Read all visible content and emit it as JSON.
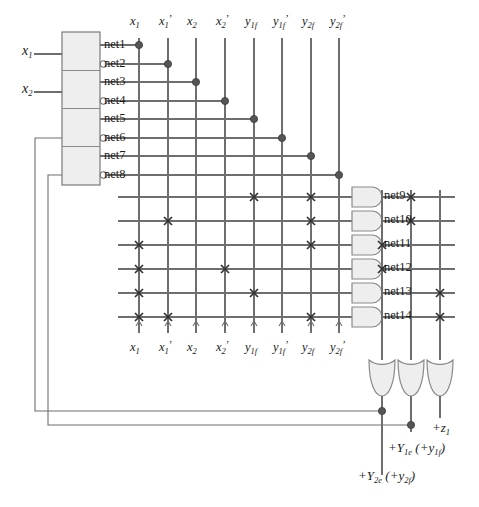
{
  "diagram": {
    "type": "logic-diagram",
    "colors": {
      "wire": "#6e6e6e",
      "dark_wire": "#3a3a3a",
      "dot": "#555555",
      "gate_fill": "#eeeeee",
      "gate_stroke": "#8a8a8a",
      "text": "#1a1a1a"
    }
  },
  "inputs": [
    {
      "name": "x1",
      "label_base": "x",
      "label_sub": "1",
      "y": 54
    },
    {
      "name": "x2",
      "label_base": "x",
      "label_sub": "2",
      "y": 92
    }
  ],
  "decoder": {
    "name": "input-buffer-block",
    "x": 62,
    "y": 32,
    "w": 38,
    "h": 153,
    "sections": 4,
    "nets": [
      {
        "label": "net1",
        "inverted": false,
        "y": 45
      },
      {
        "label": "net2",
        "inverted": true,
        "y": 64
      },
      {
        "label": "net3",
        "inverted": false,
        "y": 82
      },
      {
        "label": "net4",
        "inverted": true,
        "y": 101
      },
      {
        "label": "net5",
        "inverted": false,
        "y": 119
      },
      {
        "label": "net6",
        "inverted": true,
        "y": 138
      },
      {
        "label": "net7",
        "inverted": false,
        "y": 156
      },
      {
        "label": "net8",
        "inverted": true,
        "y": 175
      }
    ]
  },
  "columns": [
    {
      "index": 0,
      "x": 139,
      "base": "x",
      "sub": "1",
      "prime": false
    },
    {
      "index": 1,
      "x": 168,
      "base": "x",
      "sub": "1",
      "prime": true
    },
    {
      "index": 2,
      "x": 196,
      "base": "x",
      "sub": "2",
      "prime": false
    },
    {
      "index": 3,
      "x": 225,
      "base": "x",
      "sub": "2",
      "prime": true
    },
    {
      "index": 4,
      "x": 254,
      "base": "y",
      "sub": "1f",
      "prime": false
    },
    {
      "index": 5,
      "x": 282,
      "base": "y",
      "sub": "1f",
      "prime": true
    },
    {
      "index": 6,
      "x": 311,
      "base": "y",
      "sub": "2f",
      "prime": false
    },
    {
      "index": 7,
      "x": 339,
      "base": "y",
      "sub": "2f",
      "prime": true
    }
  ],
  "connection_dots": [
    {
      "net": "net1",
      "column": 0,
      "x": 139,
      "y": 45
    },
    {
      "net": "net2",
      "column": 1,
      "x": 168,
      "y": 64
    },
    {
      "net": "net3",
      "column": 2,
      "x": 196,
      "y": 82
    },
    {
      "net": "net4",
      "column": 3,
      "x": 225,
      "y": 101
    },
    {
      "net": "net5",
      "column": 4,
      "x": 254,
      "y": 119
    },
    {
      "net": "net6",
      "column": 5,
      "x": 282,
      "y": 138
    },
    {
      "net": "net7",
      "column": 6,
      "x": 311,
      "y": 156
    },
    {
      "net": "net8",
      "column": 7,
      "x": 339,
      "y": 175
    }
  ],
  "and_plane": {
    "rows": [
      {
        "label": "net9",
        "y": 197,
        "crosses": [
          4,
          6
        ]
      },
      {
        "label": "net10",
        "y": 221,
        "crosses": [
          1,
          6
        ]
      },
      {
        "label": "net11",
        "y": 245,
        "crosses": [
          0,
          6
        ]
      },
      {
        "label": "net12",
        "y": 269,
        "crosses": [
          0,
          3
        ]
      },
      {
        "label": "net13",
        "y": 293,
        "crosses": [
          0,
          4
        ]
      },
      {
        "label": "net14",
        "y": 317,
        "crosses": [
          0,
          1,
          6
        ]
      }
    ],
    "gate_x": 352,
    "gate_w": 30,
    "gate_h": 20
  },
  "or_plane": {
    "columns": [
      {
        "index": 0,
        "x": 382,
        "output": "Y2e"
      },
      {
        "index": 1,
        "x": 411,
        "output": "Y1e"
      },
      {
        "index": 2,
        "x": 440,
        "output": "z1"
      }
    ],
    "crosses": [
      {
        "row": "net9",
        "column": 1
      },
      {
        "row": "net10",
        "column": 1
      },
      {
        "row": "net11",
        "column": 0
      },
      {
        "row": "net12",
        "column": 0
      },
      {
        "row": "net13",
        "column": 2
      },
      {
        "row": "net14",
        "column": 2
      }
    ]
  },
  "output_gates": [
    {
      "name": "or-gate-Y2e",
      "x": 382,
      "y": 360
    },
    {
      "name": "or-gate-Y1e",
      "x": 411,
      "y": 360
    },
    {
      "name": "or-gate-z1",
      "x": 440,
      "y": 360
    }
  ],
  "outputs": [
    {
      "name": "z1-output",
      "text": "+z",
      "sub": "1",
      "paren": ""
    },
    {
      "name": "Y1e-output",
      "text": "+Y",
      "sub": "1e",
      "paren": "(+y1f)"
    },
    {
      "name": "Y2e-output",
      "text": "+Y",
      "sub": "2e",
      "paren": "(+y2f)"
    }
  ],
  "feedback": [
    {
      "name": "feedback-y1f",
      "from_x": 411,
      "from_y": 425,
      "to_x": 48,
      "to_y": 175
    },
    {
      "name": "feedback-y2f",
      "from_x": 382,
      "from_y": 411,
      "to_x": 35,
      "to_y": 138
    }
  ]
}
